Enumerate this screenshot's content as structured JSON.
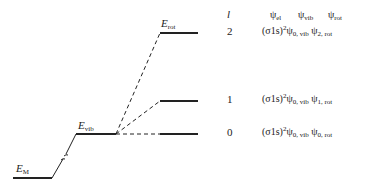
{
  "diagram": {
    "levels": {
      "E_M": {
        "symbol": "E",
        "subscript": "M"
      },
      "E_vib": {
        "symbol": "E",
        "subscript": "vib"
      },
      "E_rot": {
        "symbol": "E",
        "subscript": "rot"
      }
    },
    "table": {
      "col_l_header": "l",
      "headers": [
        {
          "psi": "ψ",
          "sub": "el"
        },
        {
          "psi": "ψ",
          "sub": "vib"
        },
        {
          "psi": "ψ",
          "sub": "rot"
        }
      ],
      "rows": [
        {
          "l": "2",
          "orbital": "(σ1s)",
          "power": "2",
          "psi1": "ψ",
          "sub1": "0, vib",
          "psi2": "ψ",
          "sub2": "2, rot"
        },
        {
          "l": "1",
          "orbital": "(σ1s)",
          "power": "2",
          "psi1": "ψ",
          "sub1": "0, vib",
          "psi2": "ψ",
          "sub2": "1, rot"
        },
        {
          "l": "0",
          "orbital": "(σ1s)",
          "power": "2",
          "psi1": "ψ",
          "sub1": "0, vib",
          "psi2": "ψ",
          "sub2": "0, rot"
        }
      ]
    }
  }
}
